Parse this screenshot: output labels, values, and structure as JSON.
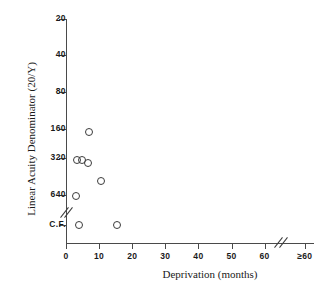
{
  "chart_data": {
    "type": "scatter",
    "title": "",
    "xlabel": "Deprivation (months)",
    "ylabel": "Linear Acuity Denominator (20/Y)",
    "x_ticks": [
      "0",
      "10",
      "20",
      "30",
      "40",
      "50",
      "60",
      "≥60"
    ],
    "x_tick_values": [
      0,
      10,
      20,
      30,
      40,
      50,
      60,
      70
    ],
    "y_ticks": [
      "20",
      "40",
      "80",
      "160",
      "320",
      "640",
      "C.F."
    ],
    "y_tick_values": [
      20,
      40,
      80,
      160,
      320,
      640,
      1280
    ],
    "xlim": [
      0,
      70
    ],
    "grid": false,
    "legend": null,
    "axis_breaks": {
      "y_break_between": [
        "640",
        "C.F."
      ],
      "x_break_between": [
        "60",
        "≥60"
      ]
    },
    "points": [
      {
        "x": 7,
        "y": 170,
        "x_label": "7",
        "y_label": "170"
      },
      {
        "x": 3.2,
        "y": 330,
        "x_label": "3.2",
        "y_label": "330"
      },
      {
        "x": 4.8,
        "y": 330,
        "x_label": "4.8",
        "y_label": "330"
      },
      {
        "x": 6.5,
        "y": 350,
        "x_label": "6.5",
        "y_label": "350"
      },
      {
        "x": 10.5,
        "y": 490,
        "x_label": "10.5",
        "y_label": "490"
      },
      {
        "x": 3.0,
        "y": 660,
        "x_label": "3",
        "y_label": "660"
      },
      {
        "x": 4.0,
        "y": 1280,
        "x_label": "4",
        "y_label": "C.F."
      },
      {
        "x": 15.5,
        "y": 1280,
        "x_label": "15.5",
        "y_label": "C.F."
      }
    ]
  }
}
